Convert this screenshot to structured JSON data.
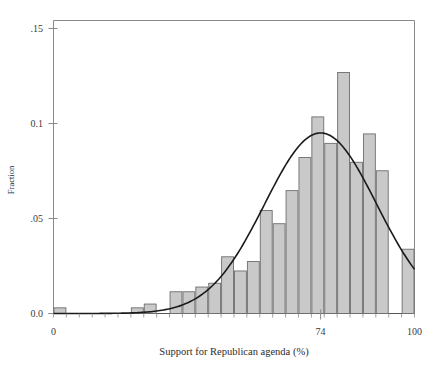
{
  "chart_data": {
    "type": "bar",
    "title": "",
    "subtitle": "",
    "xlabel": "Support for Republican agenda (%)",
    "ylabel": "Fraction",
    "xlim": [
      0,
      100
    ],
    "ylim": [
      0,
      0.155
    ],
    "grid": false,
    "legend": "none",
    "x_tick_values": [
      0,
      74,
      100
    ],
    "x_tick_labels": [
      "0",
      "74",
      "100"
    ],
    "y_tick_values": [
      0.0,
      0.05,
      0.1,
      0.15
    ],
    "y_tick_labels": [
      "0.0",
      ".05",
      "0.1",
      ".15"
    ],
    "bin_width": 3.5714,
    "bar_fill_color": "#c9c9c9",
    "bar_edge_color": "#6e6e6e",
    "curve_color": "#1a1a1a",
    "axis_color": "#7d7d7d",
    "categories": [
      "0-3.6",
      "3.6-7.1",
      "7.1-10.7",
      "10.7-14.3",
      "14.3-17.9",
      "17.9-21.4",
      "21.4-25.0",
      "25.0-28.6",
      "28.6-32.1",
      "32.1-35.7",
      "35.7-39.3",
      "39.3-42.9",
      "42.9-46.4",
      "46.4-50.0",
      "50.0-53.6",
      "53.6-57.1",
      "57.1-60.7",
      "60.7-64.3",
      "64.3-67.9",
      "67.9-71.4",
      "71.4-75.0",
      "75.0-78.6",
      "78.6-82.1",
      "82.1-85.7",
      "85.7-89.3",
      "89.3-92.9",
      "92.9-96.4",
      "96.4-100"
    ],
    "values": [
      0.003,
      0.0,
      0.0,
      0.0,
      0.0,
      0.0,
      0.003,
      0.005,
      0.0,
      0.0115,
      0.0115,
      0.014,
      0.016,
      0.03,
      0.0225,
      0.0275,
      0.0545,
      0.0475,
      0.065,
      0.0825,
      0.104,
      0.09,
      0.1275,
      0.08,
      0.095,
      0.0755,
      0.0,
      0.034
    ],
    "overlay_curve": {
      "name": "normal-density-fit",
      "type": "line",
      "mean": 74.0,
      "peak_value": 0.0955,
      "std_dev": 15.5,
      "points_x": [
        0,
        5,
        10,
        15,
        20,
        25,
        30,
        35,
        40,
        45,
        50,
        55,
        60,
        65,
        70,
        74,
        78,
        82,
        86,
        90,
        94,
        100
      ],
      "points_y": [
        0.0005,
        0.0006,
        0.0009,
        0.0013,
        0.0021,
        0.0034,
        0.0057,
        0.0096,
        0.0157,
        0.0248,
        0.0374,
        0.053,
        0.0697,
        0.0845,
        0.0938,
        0.0955,
        0.0925,
        0.084,
        0.071,
        0.0555,
        0.04,
        0.0285
      ]
    }
  },
  "axes": {
    "y_label": "Fraction",
    "x_label": "Support for Republican agenda (%)"
  }
}
